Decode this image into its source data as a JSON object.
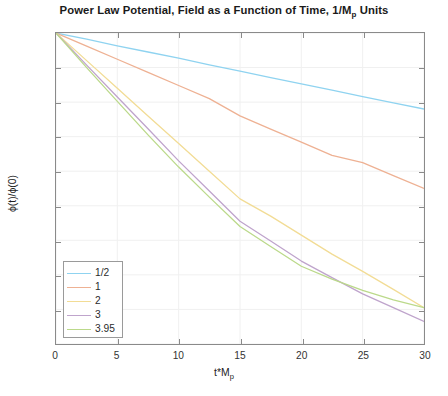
{
  "figure": {
    "title_main": "Power Law Potential, Field as a Function of Time, 1/M",
    "title_sub": "p",
    "title_tail": " Units",
    "title_full": "Power Law Potential, Field as a Function of Time, 1/M_p Units"
  },
  "axes": {
    "xlabel_main": "t*M",
    "xlabel_sub": "p",
    "ylabel_main": "ϕ(t)/ϕ(0)",
    "xticks": [
      "0",
      "5",
      "10",
      "15",
      "20",
      "25",
      "30"
    ],
    "xtick_values": [
      0,
      5,
      10,
      15,
      20,
      25,
      30
    ],
    "yticks": [
      "0.1",
      "0.2",
      "0.3",
      "0.4",
      "0.5",
      "0.6",
      "0.7",
      "0.8",
      "0.9",
      "1"
    ],
    "ytick_values": [
      0.1,
      0.2,
      0.3,
      0.4,
      0.5,
      0.6,
      0.7,
      0.8,
      0.9,
      1.0
    ]
  },
  "legend": {
    "position": "lower-left-inside",
    "entries": [
      {
        "label": "1/2",
        "color": "#8fd3f0"
      },
      {
        "label": "1",
        "color": "#eeb193"
      },
      {
        "label": "2",
        "color": "#f2dc95"
      },
      {
        "label": "3",
        "color": "#bfa4cc"
      },
      {
        "label": "3.95",
        "color": "#bbd98a"
      }
    ]
  },
  "chart_data": {
    "type": "line",
    "xlabel": "t*M_p",
    "ylabel": "ϕ(t)/ϕ(0)",
    "xlim": [
      0,
      30
    ],
    "ylim": [
      0.1,
      1.0
    ],
    "grid": true,
    "legend_position": "lower left",
    "x": [
      0,
      2.5,
      5,
      7.5,
      10,
      12.5,
      15,
      17.5,
      20,
      22.5,
      25,
      27.5,
      30
    ],
    "series": [
      {
        "name": "1/2",
        "color": "#8fd3f0",
        "values": [
          1.0,
          0.982,
          0.963,
          0.945,
          0.927,
          0.908,
          0.89,
          0.871,
          0.853,
          0.835,
          0.816,
          0.798,
          0.78
        ]
      },
      {
        "name": "1",
        "color": "#eeb193",
        "values": [
          1.0,
          0.962,
          0.924,
          0.886,
          0.848,
          0.81,
          0.76,
          0.722,
          0.684,
          0.646,
          0.625,
          0.587,
          0.55
        ]
      },
      {
        "name": "2",
        "color": "#f2dc95",
        "values": [
          1.0,
          0.92,
          0.84,
          0.76,
          0.68,
          0.6,
          0.52,
          0.47,
          0.415,
          0.36,
          0.31,
          0.258,
          0.205
        ]
      },
      {
        "name": "3",
        "color": "#bfa4cc",
        "values": [
          1.0,
          0.907,
          0.815,
          0.723,
          0.63,
          0.543,
          0.455,
          0.398,
          0.34,
          0.292,
          0.245,
          0.205,
          0.165
        ]
      },
      {
        "name": "3.95",
        "color": "#bbd98a",
        "values": [
          1.0,
          0.9,
          0.802,
          0.705,
          0.612,
          0.525,
          0.44,
          0.382,
          0.325,
          0.288,
          0.255,
          0.228,
          0.205
        ]
      }
    ]
  }
}
